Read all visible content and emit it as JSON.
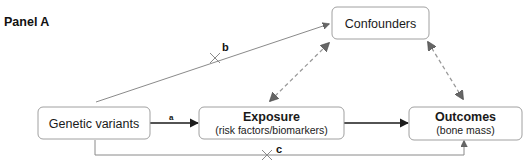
{
  "panel_label": "Panel A",
  "nodes": {
    "genetic": {
      "title": "Genetic variants"
    },
    "exposure": {
      "title": "Exposure",
      "subtitle": "(risk factors/biomarkers)"
    },
    "outcomes": {
      "title": "Outcomes",
      "subtitle": "(bone mass)"
    },
    "confounders": {
      "title": "Confounders"
    }
  },
  "edges": {
    "a": {
      "label": "a",
      "from": "Genetic variants",
      "to": "Exposure",
      "style": "solid",
      "blocked": false
    },
    "b": {
      "label": "b",
      "from": "Genetic variants",
      "to": "Confounders",
      "style": "solid",
      "blocked": true
    },
    "c": {
      "label": "c",
      "from": "Genetic variants",
      "to": "Outcomes",
      "style": "solid-elbow",
      "blocked": true
    },
    "exposure_outcomes": {
      "label": "",
      "from": "Exposure",
      "to": "Outcomes",
      "style": "solid",
      "blocked": false
    },
    "confounders_exposure": {
      "label": "",
      "from": "Confounders",
      "to": "Exposure",
      "style": "dashed-bidirectional",
      "blocked": false
    },
    "confounders_outcomes": {
      "label": "",
      "from": "Confounders",
      "to": "Outcomes",
      "style": "dashed-bidirectional",
      "blocked": false
    }
  },
  "colors": {
    "box_border": "#a0a0a0",
    "text": "#1a1a1a",
    "arrow_dark": "#1a1a1a",
    "arrow_grey": "#8a8a8a",
    "arrowhead_grey": "#666666"
  }
}
